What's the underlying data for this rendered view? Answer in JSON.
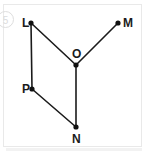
{
  "page": {
    "background_color": "#ffffff",
    "border_color": "#e9e9e9"
  },
  "question_number": {
    "label": "5",
    "style": "circled",
    "color": "#dcdcdc"
  },
  "figure": {
    "type": "geometry-diagram",
    "stroke_color": "#1b1b1b",
    "vertex_color": "#111111",
    "vertices": [
      {
        "id": "L",
        "label": "L",
        "x": 31,
        "y": 23,
        "label_x": 22,
        "label_y": 27
      },
      {
        "id": "M",
        "label": "M",
        "x": 118,
        "y": 23,
        "label_x": 123,
        "label_y": 27
      },
      {
        "id": "O",
        "label": "O",
        "x": 76,
        "y": 65,
        "label_x": 72,
        "label_y": 58
      },
      {
        "id": "P",
        "label": "P",
        "x": 32,
        "y": 89,
        "label_x": 22,
        "label_y": 93
      },
      {
        "id": "N",
        "label": "N",
        "x": 76,
        "y": 127,
        "label_x": 72,
        "label_y": 143
      }
    ],
    "segments": [
      {
        "id": "LO",
        "from": "L",
        "to": "O",
        "x1": 31,
        "y1": 23,
        "x2": 76,
        "y2": 65
      },
      {
        "id": "MO",
        "from": "M",
        "to": "O",
        "x1": 118,
        "y1": 23,
        "x2": 76,
        "y2": 65
      },
      {
        "id": "LP",
        "from": "L",
        "to": "P",
        "x1": 31,
        "y1": 23,
        "x2": 32,
        "y2": 89
      },
      {
        "id": "PN",
        "from": "P",
        "to": "N",
        "x1": 32,
        "y1": 89,
        "x2": 76,
        "y2": 127
      },
      {
        "id": "ON",
        "from": "O",
        "to": "N",
        "x1": 76,
        "y1": 65,
        "x2": 76,
        "y2": 127
      }
    ]
  }
}
